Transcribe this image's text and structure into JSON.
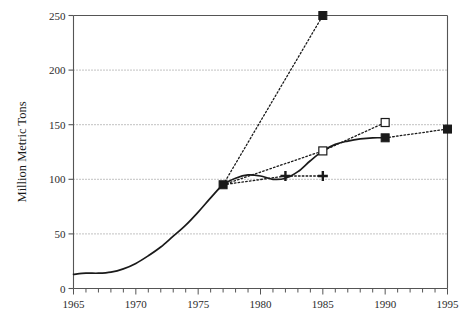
{
  "chart_data": {
    "type": "line",
    "title": "",
    "xlabel": "",
    "ylabel": "Million Metric Tons",
    "xlim": [
      1965,
      1995
    ],
    "ylim": [
      0,
      250
    ],
    "ytick_values": [
      0,
      50,
      100,
      150,
      200,
      250
    ],
    "ytick_labels": [
      "0",
      "50",
      "100",
      "150",
      "200",
      "250"
    ],
    "xtick_values": [
      1965,
      1970,
      1975,
      1980,
      1985,
      1990,
      1995
    ],
    "xtick_labels": [
      "1965",
      "1970",
      "1975",
      "1980",
      "1985",
      "1990",
      "1995"
    ],
    "minor_xtick_step": 1,
    "grid": "horizontal-dotted",
    "legend": "none",
    "series": [
      {
        "name": "historical-and-actual",
        "style": "solid",
        "marker": "none",
        "x": [
          1965,
          1966,
          1967,
          1968,
          1969,
          1970,
          1971,
          1972,
          1973,
          1974,
          1975,
          1976,
          1977,
          1978,
          1979,
          1980,
          1981,
          1982,
          1983,
          1984,
          1985,
          1986,
          1987,
          1988,
          1989,
          1990
        ],
        "values": [
          13,
          14,
          14,
          15,
          18,
          23,
          30,
          38,
          48,
          58,
          70,
          83,
          95,
          101,
          104,
          103,
          100,
          101,
          107,
          117,
          126,
          132,
          135,
          137,
          138,
          138
        ]
      },
      {
        "name": "projection-high",
        "style": "dotted",
        "marker": "filled-square",
        "x": [
          1977,
          1985
        ],
        "values": [
          95,
          250
        ]
      },
      {
        "name": "projection-medium",
        "style": "dotted",
        "marker": "open-square",
        "x": [
          1977,
          1985,
          1990
        ],
        "values": [
          95,
          126,
          152
        ]
      },
      {
        "name": "projection-flat",
        "style": "dotted",
        "marker": "plus",
        "x": [
          1977,
          1982,
          1985
        ],
        "values": [
          95,
          103,
          103
        ]
      },
      {
        "name": "actual-late",
        "style": "dotted",
        "marker": "filled-square",
        "x": [
          1990,
          1995
        ],
        "values": [
          138,
          146
        ]
      }
    ],
    "markers": [
      {
        "name": "marker-1977-base",
        "x": 1977,
        "y": 95,
        "shape": "filled-square"
      },
      {
        "name": "marker-1985-high",
        "x": 1985,
        "y": 250,
        "shape": "filled-square"
      },
      {
        "name": "marker-1985-medium",
        "x": 1985,
        "y": 126,
        "shape": "open-square"
      },
      {
        "name": "marker-1990-medium",
        "x": 1990,
        "y": 152,
        "shape": "open-square"
      },
      {
        "name": "marker-1982-flat",
        "x": 1982,
        "y": 103,
        "shape": "plus"
      },
      {
        "name": "marker-1985-flat",
        "x": 1985,
        "y": 103,
        "shape": "plus"
      },
      {
        "name": "marker-1990-actual",
        "x": 1990,
        "y": 138,
        "shape": "filled-square"
      },
      {
        "name": "marker-1995-actual",
        "x": 1995,
        "y": 146,
        "shape": "filled-square"
      }
    ],
    "colors": {
      "line": "#1a1a1a",
      "grid": "#777777",
      "axis": "#555555",
      "background": "#ffffff"
    }
  }
}
